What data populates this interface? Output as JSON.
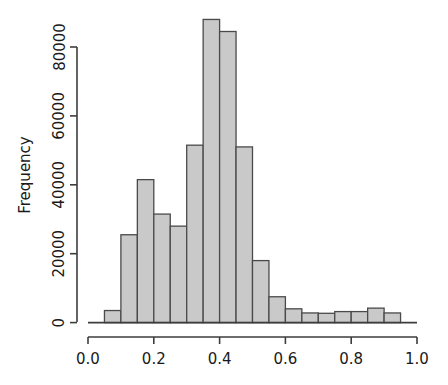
{
  "figure": {
    "background": "#ffffff",
    "bar_fill": "#c9c9c9",
    "bar_stroke": "#4a4a4a",
    "axis_color": "#3d3d3d",
    "text_color": "#1a1a1a"
  },
  "chart_data": {
    "type": "bar",
    "title": "",
    "xlabel": "",
    "ylabel": "Frequency",
    "grid": false,
    "legend": false,
    "xlim": [
      0.0,
      1.0
    ],
    "ylim": [
      0,
      88000
    ],
    "bin_width": 0.05,
    "bin_edges": [
      0.05,
      0.1,
      0.15,
      0.2,
      0.25,
      0.3,
      0.35,
      0.4,
      0.45,
      0.5,
      0.55,
      0.6,
      0.65,
      0.7,
      0.75,
      0.8,
      0.85,
      0.9,
      0.95
    ],
    "categories": [
      "0.05-0.10",
      "0.10-0.15",
      "0.15-0.20",
      "0.20-0.25",
      "0.25-0.30",
      "0.30-0.35",
      "0.35-0.40",
      "0.40-0.45",
      "0.45-0.50",
      "0.50-0.55",
      "0.55-0.60",
      "0.60-0.65",
      "0.65-0.70",
      "0.70-0.75",
      "0.75-0.80",
      "0.80-0.85",
      "0.85-0.90",
      "0.90-0.95"
    ],
    "values": [
      3500,
      25500,
      41500,
      31500,
      28000,
      51500,
      88000,
      84500,
      51000,
      18000,
      7500,
      4000,
      2800,
      2700,
      3200,
      3200,
      4200,
      2800
    ],
    "xticks": [
      0.0,
      0.2,
      0.4,
      0.6,
      0.8,
      1.0
    ],
    "xtick_labels": [
      "0.0",
      "0.2",
      "0.4",
      "0.6",
      "0.8",
      "1.0"
    ],
    "yticks": [
      0,
      20000,
      40000,
      60000,
      80000
    ],
    "ytick_labels": [
      "0",
      "20000",
      "40000",
      "60000",
      "80000"
    ]
  }
}
